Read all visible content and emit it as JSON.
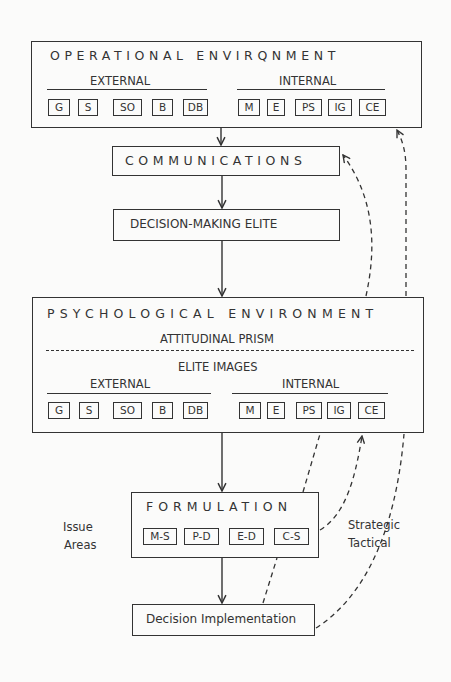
{
  "operational": {
    "title": "OPERATIONAL ENVIRQNMENT",
    "external_label": "EXTERNAL",
    "internal_label": "INTERNAL",
    "external_items": [
      "G",
      "S",
      "SO",
      "B",
      "DB"
    ],
    "internal_items": [
      "M",
      "E",
      "PS",
      "IG",
      "CE"
    ]
  },
  "communications": {
    "title": "COMMUNICATIONS"
  },
  "elite": {
    "title": "DECISION-MAKING ELITE"
  },
  "psychological": {
    "title": "PSYCHOLOGICAL ENVIRONMENT",
    "prism_label": "ATTITUDINAL PRISM",
    "images_label": "ELITE IMAGES",
    "external_label": "EXTERNAL",
    "internal_label": "INTERNAL",
    "external_items": [
      "G",
      "S",
      "SO",
      "B",
      "DB"
    ],
    "internal_items": [
      "M",
      "E",
      "PS",
      "IG",
      "CE"
    ]
  },
  "formulation": {
    "title": "FORMULATION",
    "items": [
      "M-S",
      "P-D",
      "E-D",
      "C-S"
    ]
  },
  "implementation": {
    "title": "Decision Implementation"
  },
  "side_labels": {
    "issue_areas_1": "Issue",
    "issue_areas_2": "Areas",
    "strategic": "Strategic",
    "tactical": "Tactical"
  }
}
